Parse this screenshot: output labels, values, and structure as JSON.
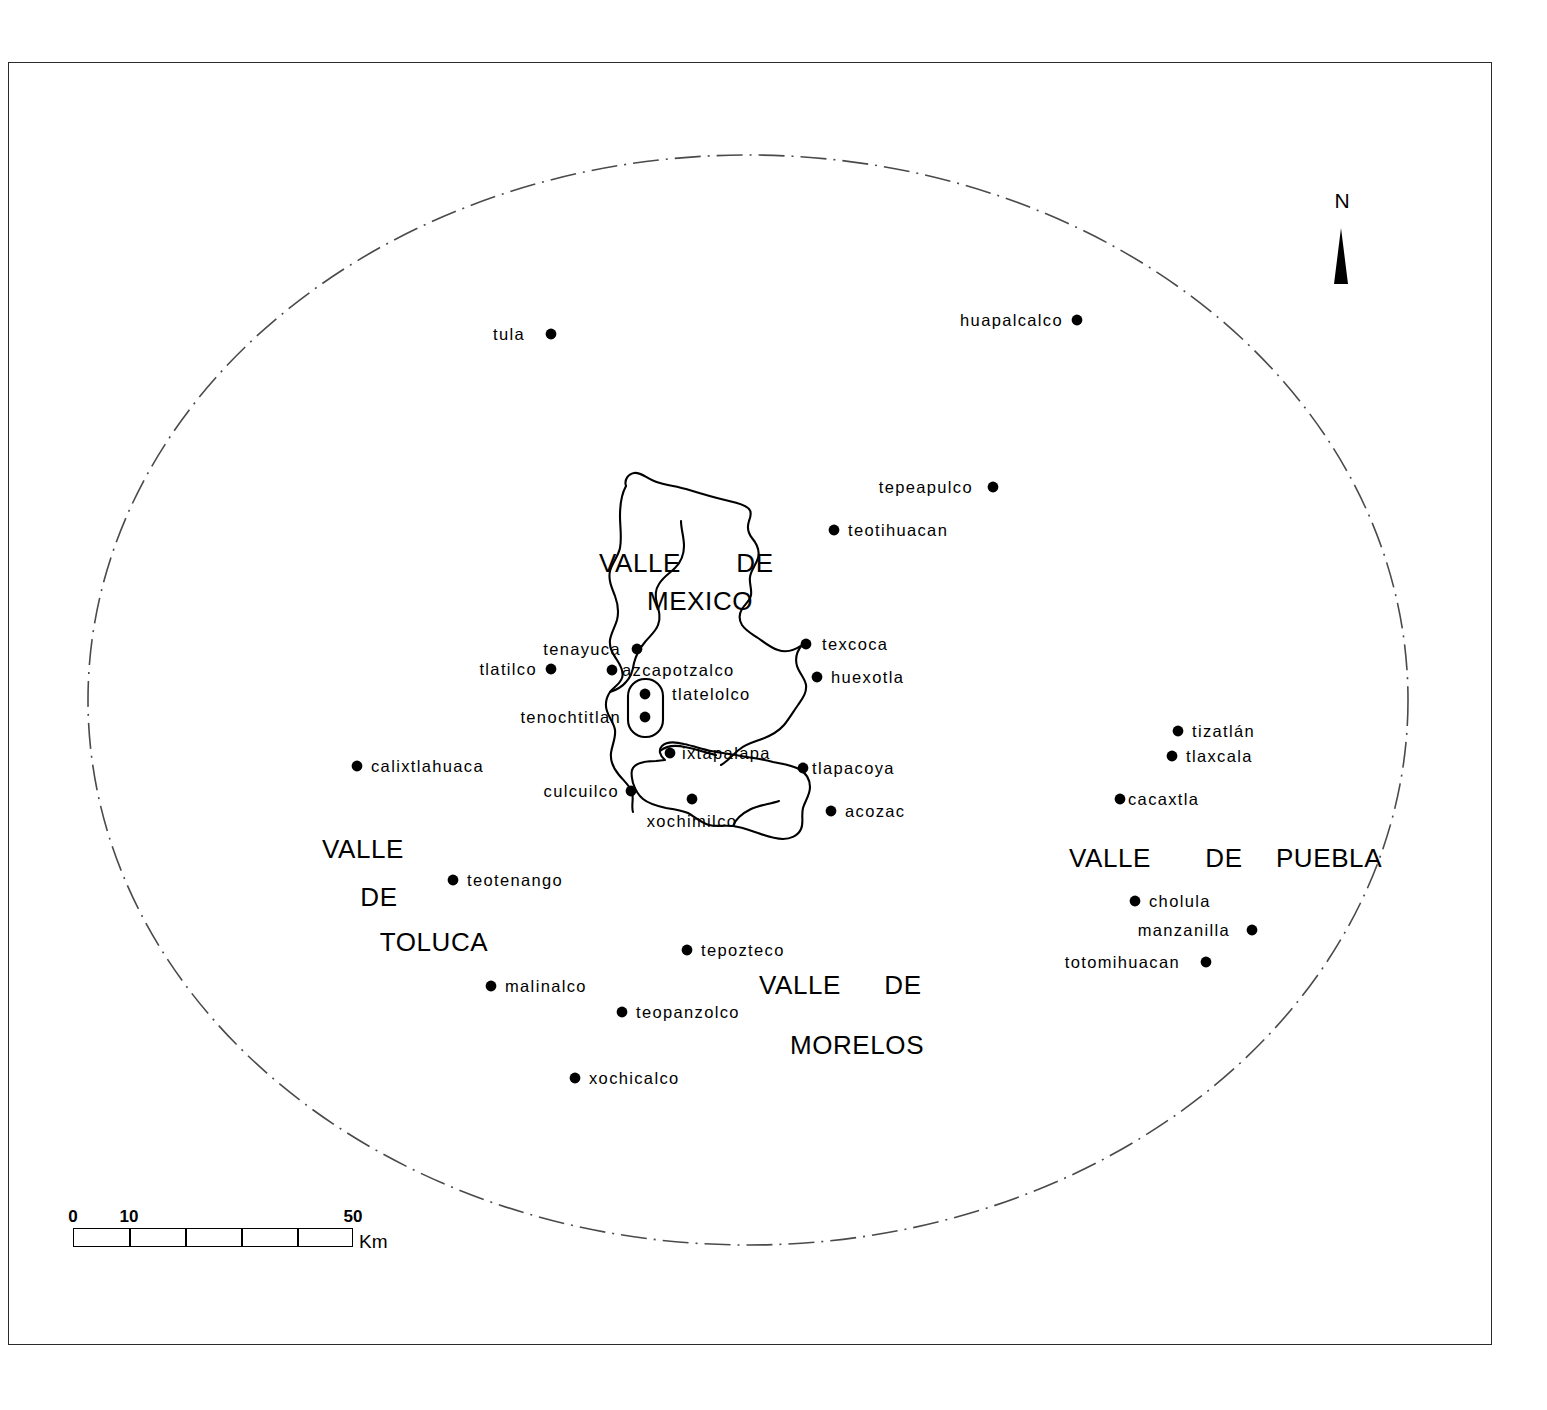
{
  "map": {
    "title": "Map of Central Mexican archaeological sites",
    "background_color": "#ffffff",
    "line_color": "#000000",
    "frame_color": "#2b2b2b",
    "boundary_style": "dash-dot ellipse"
  },
  "north_arrow": {
    "label": "N",
    "icon": "north-arrow-icon"
  },
  "scale": {
    "unit": "Km",
    "ticks": [
      {
        "value": "0",
        "pos_pct": 0
      },
      {
        "value": "10",
        "pos_pct": 20
      },
      {
        "value": "50",
        "pos_pct": 100
      }
    ],
    "segments": 5,
    "min": 0,
    "max": 50
  },
  "regions": [
    {
      "name": "valle-de-mexico",
      "words": [
        {
          "text": "VALLE",
          "x": 640,
          "y": 563
        },
        {
          "text": "DE",
          "x": 755,
          "y": 563
        },
        {
          "text": "MEXICO",
          "x": 700,
          "y": 601
        }
      ]
    },
    {
      "name": "valle-de-toluca",
      "words": [
        {
          "text": "VALLE",
          "x": 363,
          "y": 849
        },
        {
          "text": "DE",
          "x": 379,
          "y": 897
        },
        {
          "text": "TOLUCA",
          "x": 434,
          "y": 942
        }
      ]
    },
    {
      "name": "valle-de-morelos",
      "words": [
        {
          "text": "VALLE",
          "x": 800,
          "y": 985
        },
        {
          "text": "DE",
          "x": 903,
          "y": 985
        },
        {
          "text": "MORELOS",
          "x": 857,
          "y": 1045
        }
      ]
    },
    {
      "name": "valle-de-puebla",
      "words": [
        {
          "text": "VALLE",
          "x": 1110,
          "y": 858
        },
        {
          "text": "DE",
          "x": 1224,
          "y": 858
        },
        {
          "text": "PUEBLA",
          "x": 1329,
          "y": 858
        }
      ]
    }
  ],
  "sites": [
    {
      "name": "tula",
      "label": "tula",
      "dot_x": 551,
      "dot_y": 334,
      "align": "left",
      "gap": 26
    },
    {
      "name": "huapalcalco",
      "label": "huapalcalco",
      "dot_x": 1077,
      "dot_y": 320,
      "align": "left",
      "gap": 14
    },
    {
      "name": "tepeapulco",
      "label": "tepeapulco",
      "dot_x": 993,
      "dot_y": 487,
      "align": "left",
      "gap": 20
    },
    {
      "name": "teotihuacan",
      "label": "teotihuacan",
      "dot_x": 834,
      "dot_y": 530,
      "align": "right",
      "gap": 14
    },
    {
      "name": "tenayuca",
      "label": "tenayuca",
      "dot_x": 637,
      "dot_y": 649,
      "align": "left",
      "gap": 16
    },
    {
      "name": "texcoca",
      "label": "texcoca",
      "dot_x": 806,
      "dot_y": 644,
      "align": "right",
      "gap": 16
    },
    {
      "name": "tlatilco",
      "label": "tlatilco",
      "dot_x": 551,
      "dot_y": 669,
      "align": "left",
      "gap": 14
    },
    {
      "name": "azcapotzalco",
      "label": "azcapotzalco",
      "dot_x": 612,
      "dot_y": 670,
      "align": "right",
      "gap": 10
    },
    {
      "name": "huexotla",
      "label": "huexotla",
      "dot_x": 817,
      "dot_y": 677,
      "align": "right",
      "gap": 14
    },
    {
      "name": "tlatelolco",
      "label": "tlatelolco",
      "dot_x": 645,
      "dot_y": 694,
      "align": "right",
      "gap": 27
    },
    {
      "name": "tenochtitlan",
      "label": "tenochtitlan",
      "dot_x": 645,
      "dot_y": 717,
      "align": "left",
      "gap": 24
    },
    {
      "name": "tizatlan",
      "label": "tizatlán",
      "dot_x": 1178,
      "dot_y": 731,
      "align": "right",
      "gap": 14
    },
    {
      "name": "tlaxcala",
      "label": "tlaxcala",
      "dot_x": 1172,
      "dot_y": 756,
      "align": "right",
      "gap": 14
    },
    {
      "name": "ixtapalapa",
      "label": "ixtapalapa",
      "dot_x": 670,
      "dot_y": 753,
      "align": "right",
      "gap": 12
    },
    {
      "name": "calixtlahuaca",
      "label": "calixtlahuaca",
      "dot_x": 357,
      "dot_y": 766,
      "align": "right",
      "gap": 14
    },
    {
      "name": "tlapacoya",
      "label": "tlapacoya",
      "dot_x": 803,
      "dot_y": 768,
      "align": "right",
      "gap": 9
    },
    {
      "name": "cacaxtla",
      "label": "cacaxtla",
      "dot_x": 1120,
      "dot_y": 799,
      "align": "right",
      "gap": 8
    },
    {
      "name": "culcuilco",
      "label": "culcuilco",
      "dot_x": 631,
      "dot_y": 791,
      "align": "left",
      "gap": 12
    },
    {
      "name": "acozac",
      "label": "acozac",
      "dot_x": 831,
      "dot_y": 811,
      "align": "right",
      "gap": 14
    },
    {
      "name": "xochimilco",
      "label": "xochimilco",
      "dot_x": 692,
      "dot_y": 799,
      "align": "below",
      "gap": 14
    },
    {
      "name": "cholula",
      "label": "cholula",
      "dot_x": 1135,
      "dot_y": 901,
      "align": "right",
      "gap": 14
    },
    {
      "name": "teotenango",
      "label": "teotenango",
      "dot_x": 453,
      "dot_y": 880,
      "align": "right",
      "gap": 14
    },
    {
      "name": "manzanilla",
      "label": "manzanilla",
      "dot_x": 1252,
      "dot_y": 930,
      "align": "left",
      "gap": 22
    },
    {
      "name": "tepozteco",
      "label": "tepozteco",
      "dot_x": 687,
      "dot_y": 950,
      "align": "right",
      "gap": 14
    },
    {
      "name": "totomihuacan",
      "label": "totomihuacan",
      "dot_x": 1206,
      "dot_y": 962,
      "align": "left",
      "gap": 26
    },
    {
      "name": "malinalco",
      "label": "malinalco",
      "dot_x": 491,
      "dot_y": 986,
      "align": "right",
      "gap": 14
    },
    {
      "name": "teopanzolco",
      "label": "teopanzolco",
      "dot_x": 622,
      "dot_y": 1012,
      "align": "right",
      "gap": 14
    },
    {
      "name": "xochicalco",
      "label": "xochicalco",
      "dot_x": 575,
      "dot_y": 1078,
      "align": "right",
      "gap": 14
    }
  ]
}
